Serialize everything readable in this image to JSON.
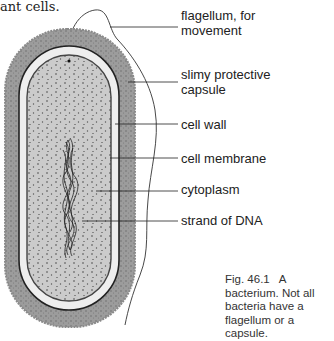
{
  "header_fragment": "ant cells.",
  "labels": [
    {
      "id": "flagellum",
      "text": "flagellum, for movement",
      "y": 8
    },
    {
      "id": "capsule",
      "text": "slimy protective capsule",
      "y": 72
    },
    {
      "id": "cell-wall",
      "text": "cell wall",
      "y": 117
    },
    {
      "id": "cell-membrane",
      "text": "cell membrane",
      "y": 151
    },
    {
      "id": "cytoplasm",
      "text": "cytoplasm",
      "y": 182
    },
    {
      "id": "dna",
      "text": "strand of DNA",
      "y": 213
    }
  ],
  "caption": {
    "fig_number": "Fig. 46.1",
    "text": "A bacterium. Not all bacteria have a flagellum or a capsule."
  },
  "colors": {
    "capsule": "#9a9a9a",
    "cell_wall_fill": "#ececec",
    "cytoplasm": "#c8c8c8",
    "outline": "#222222"
  }
}
